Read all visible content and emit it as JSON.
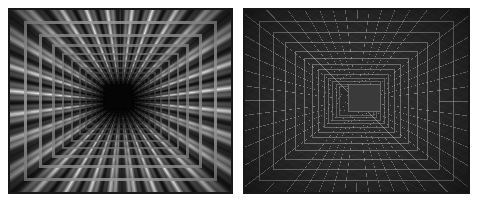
{
  "figure": {
    "background_color": "#ffffff",
    "width": 477,
    "height": 202,
    "panel_count": 2
  },
  "panels": [
    {
      "id": "left",
      "name": "lit-render",
      "label": "Shaded tunnel render",
      "description": "Photorealistic grayscale render of an infinitely receding rectangular corridor with rows of bright lamp highlights along every wall.",
      "frame_color": "#141414",
      "wall_color": "#8a8a8a",
      "highlight_color": "#ffffff",
      "center_color": "#050505",
      "vanishing_point": {
        "x": 0.5,
        "y": 0.5
      },
      "recursion_levels": 12,
      "lamps_per_wall": 13,
      "bounds": {
        "x": 8,
        "y": 8,
        "width": 225,
        "height": 186
      }
    },
    {
      "id": "right",
      "name": "wireframe-render",
      "label": "Wireframe tunnel render",
      "description": "Dark wireframe version of the same recursive rectangular corridor showing the perspective grid lines converging to the vanishing point.",
      "frame_color": "#1c1c1c",
      "wall_color": "#2b2b2b",
      "grid_line_color": "#c3c3c3",
      "center_color": "#3a3a3a",
      "vanishing_point": {
        "x": 0.5,
        "y": 0.5
      },
      "recursion_levels": 12,
      "grid_rays": 48,
      "bounds": {
        "x": 243,
        "y": 8,
        "width": 227,
        "height": 186
      }
    }
  ],
  "rings": {
    "left_scales": [
      0.855,
      0.725,
      0.612,
      0.518,
      0.438,
      0.37,
      0.312,
      0.263,
      0.222,
      0.187,
      0.158,
      0.133
    ],
    "right_scales": [
      0.862,
      0.738,
      0.632,
      0.541,
      0.463,
      0.396,
      0.339,
      0.29,
      0.248,
      0.212,
      0.182,
      0.156
    ]
  },
  "center_hole": {
    "left": {
      "x": 105,
      "y": 85,
      "width": 26,
      "height": 23
    },
    "right": {
      "x": 348,
      "y": 84,
      "width": 31,
      "height": 26
    }
  }
}
